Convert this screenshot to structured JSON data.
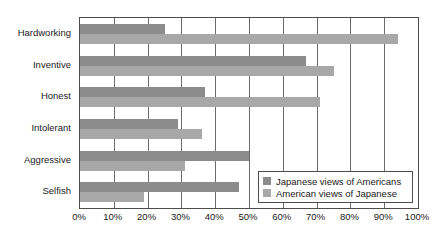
{
  "chart_data": {
    "type": "bar",
    "orientation": "horizontal",
    "title": "",
    "subtitle": "",
    "xlabel": "",
    "ylabel": "",
    "xlim": [
      0,
      100
    ],
    "xtick_step": 10,
    "xticks": [
      "0%",
      "10%",
      "20%",
      "30%",
      "40%",
      "50%",
      "60%",
      "70%",
      "80%",
      "90%",
      "100%"
    ],
    "grid": true,
    "grid_axis": "x",
    "legend_position": "bottom-right",
    "categories": [
      "Hardworking",
      "Inventive",
      "Honest",
      "Intolerant",
      "Aggressive",
      "Selfish"
    ],
    "series": [
      {
        "name": "Japanese views of Americans",
        "color": "#8c8c8c",
        "values": [
          25,
          67,
          37,
          29,
          50,
          47
        ]
      },
      {
        "name": "American views of Japanese",
        "color": "#a8a8a8",
        "values": [
          94,
          75,
          71,
          36,
          31,
          19
        ]
      }
    ]
  },
  "legend": {
    "items": [
      {
        "label": "Japanese views of Americans"
      },
      {
        "label": "American views of Japanese"
      }
    ]
  },
  "colors": {
    "series0": "#8c8c8c",
    "series1": "#a8a8a8",
    "axis": "#4d4d4d",
    "grid": "#6b6b6b",
    "text": "#1a1a1a",
    "background": "#ffffff"
  }
}
